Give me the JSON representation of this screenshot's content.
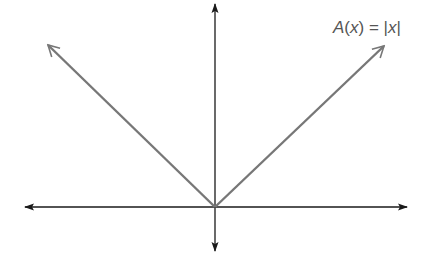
{
  "diagram": {
    "function_label": {
      "name": "A",
      "var": "x",
      "text": "A(x) = |x|",
      "parts": {
        "lhs_name": "A",
        "open": "(",
        "var": "x",
        "close": ")",
        "eq": " = ",
        "abs_open": "|",
        "abs_var": "x",
        "abs_close": "|"
      }
    },
    "axes": {
      "x_axis": {
        "y": 207,
        "x_start": 25,
        "x_end": 407,
        "color": "#1a1a1a",
        "arrows": "both"
      },
      "y_axis": {
        "x": 215,
        "y_start": 4,
        "y_end": 251,
        "color": "#1a1a1a",
        "arrows": "both"
      },
      "origin": {
        "x": 215,
        "y": 207
      }
    },
    "curve": {
      "type": "absolute-value",
      "color": "#777777",
      "vertex": {
        "x": 215,
        "y": 207
      },
      "left_end": {
        "x": 48,
        "y": 45
      },
      "right_end": {
        "x": 384,
        "y": 46
      }
    }
  }
}
